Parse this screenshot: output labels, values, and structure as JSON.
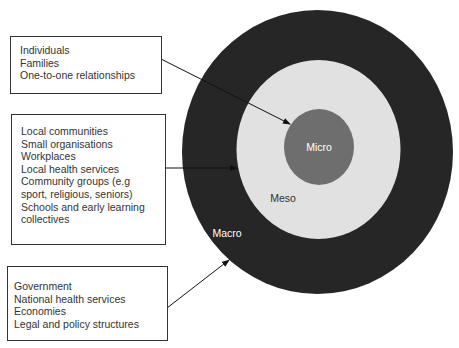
{
  "diagram": {
    "type": "concentric-circles",
    "levels": [
      {
        "name": "Macro",
        "label": "Macro",
        "color": "#262626",
        "text_color": "#ffffff",
        "items": [
          "Government",
          "National health services",
          "Economies",
          "Legal and policy structures"
        ]
      },
      {
        "name": "Meso",
        "label": "Meso",
        "color": "#e1e1e1",
        "text_color": "#333333",
        "items": [
          "Local communities",
          "Small organisations",
          "Workplaces",
          "Local health services",
          "Community groups (e.g",
          "sport, religious, seniors)",
          "Schools and early learning",
          "collectives"
        ]
      },
      {
        "name": "Micro",
        "label": "Micro",
        "color": "#6e6e6e",
        "text_color": "#ffffff",
        "items": [
          "Individuals",
          "Families",
          "One-to-one relationships"
        ]
      }
    ]
  },
  "boxes": {
    "micro": {
      "lines": [
        "Individuals",
        "Families",
        "One-to-one relationships"
      ]
    },
    "meso": {
      "lines": [
        "Local communities",
        "Small organisations",
        "Workplaces",
        "Local health services",
        "Community groups (e.g",
        "sport, religious, seniors)",
        "Schools and early learning",
        "collectives"
      ]
    },
    "macro": {
      "lines": [
        "Government",
        "National health services",
        "Economies",
        "Legal and policy structures"
      ]
    }
  },
  "circle_labels": {
    "micro": "Micro",
    "meso": "Meso",
    "macro": "Macro"
  }
}
